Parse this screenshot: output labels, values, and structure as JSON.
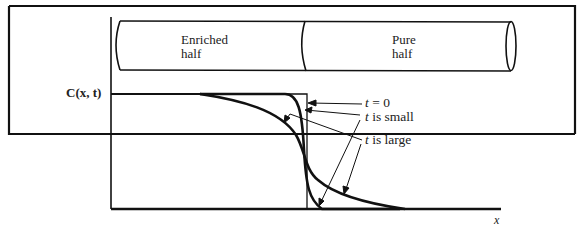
{
  "diagram": {
    "tube": {
      "left_label_line1": "Enriched",
      "left_label_line2": "half",
      "right_label_line1": "Pure",
      "right_label_line2": "half"
    },
    "axes": {
      "y_label": "C(x, t)",
      "x_label": "x"
    },
    "curves": [
      {
        "name": "t = 0",
        "var": "t",
        "rest": " = 0"
      },
      {
        "name": "t is small",
        "var": "t",
        "rest": " is small"
      },
      {
        "name": "t is large",
        "var": "t",
        "rest": " is large"
      }
    ],
    "colors": {
      "ink": "#111111",
      "background": "#ffffff"
    }
  }
}
